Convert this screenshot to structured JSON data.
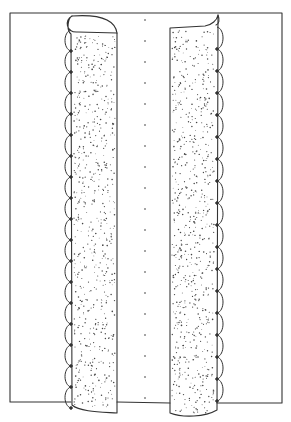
{
  "illustration": {
    "subject": "Two stippled vertical columns with scalloped outer edges inside a rectangular frame, separated by a dotted center line",
    "stroke_color": "#333333",
    "background_color": "#ffffff",
    "stipple_color": "#444444"
  }
}
